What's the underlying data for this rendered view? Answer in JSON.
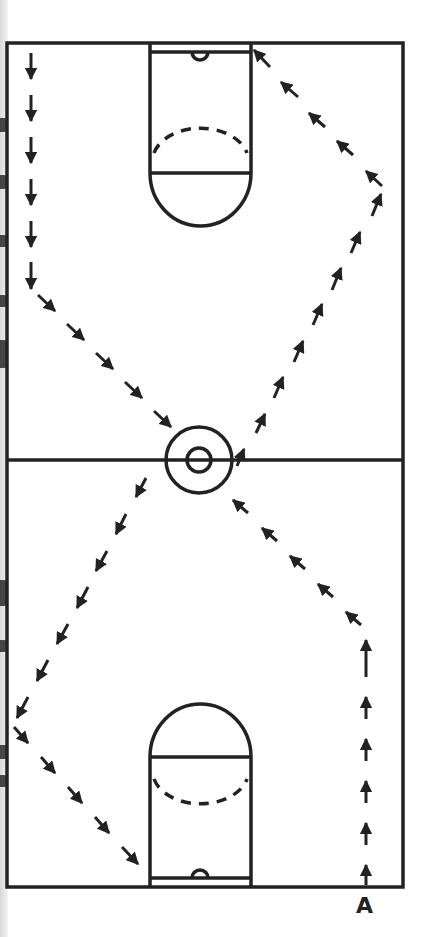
{
  "figure": {
    "type": "basketball drill diagram",
    "court": "full court with two lanes and center circle",
    "player_label": "A",
    "line_color": "#222222",
    "path_style": "dashed line with arrowheads",
    "path_description": [
      "Player A starts at bottom right baseline",
      "Runs straight up the right side",
      "Cuts diagonally toward center circle",
      "Continues diagonally up-right to right sideline",
      "Cuts diagonally up-left to top baseline at lane corner",
      "Continues along top baseline to left corner, runs down left sideline",
      "Cuts diagonally toward center circle",
      "Continues diagonally down-left to left sideline",
      "Cuts diagonally down-right to bottom lane corner"
    ]
  }
}
